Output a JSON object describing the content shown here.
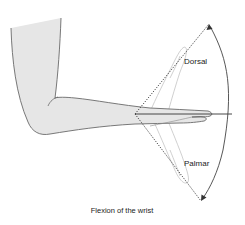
{
  "figure": {
    "caption": "Flexion of the wrist",
    "labels": {
      "dorsal": "Dorsal",
      "palmar": "Palmar"
    },
    "colors": {
      "skin_fill": "#e4e4e4",
      "outline": "#6a6a6a",
      "guide_line": "#333333",
      "ghost_hand": "#bdbdbd"
    }
  }
}
